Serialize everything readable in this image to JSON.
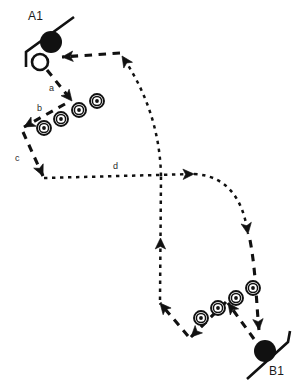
{
  "diagram": {
    "title": "",
    "colors": {
      "ink": "#111111",
      "background": "#ffffff",
      "label": "#1a1a1a"
    },
    "players": [
      {
        "id": "A1",
        "label": "A1",
        "label_pos": {
          "x": 28,
          "y": 10
        },
        "puck_pos": {
          "x": 51,
          "y": 42
        },
        "puck_r": 11,
        "open_circle_pos": {
          "x": 40,
          "y": 62
        },
        "open_circle_r": 8,
        "stick": "M 74 17 L 26 52 L 26 67"
      },
      {
        "id": "B1",
        "label": "B1",
        "label_pos": {
          "x": 269,
          "y": 365
        },
        "puck_pos": {
          "x": 265,
          "y": 351
        },
        "puck_r": 11,
        "stick": "M 247 379 L 288 342 L 290 331"
      }
    ],
    "cone_groups": [
      {
        "name": "upper-left-cones",
        "cones": [
          {
            "x": 44,
            "y": 128
          },
          {
            "x": 61,
            "y": 119
          },
          {
            "x": 79,
            "y": 110
          },
          {
            "x": 97,
            "y": 101
          }
        ]
      },
      {
        "name": "lower-right-cones",
        "cones": [
          {
            "x": 201,
            "y": 318
          },
          {
            "x": 218,
            "y": 308
          },
          {
            "x": 236,
            "y": 298
          },
          {
            "x": 253,
            "y": 288
          }
        ]
      }
    ],
    "cone": {
      "outer_r": 7,
      "mid_r": 4.6,
      "inner_r": 1.9
    },
    "step_labels": [
      {
        "id": "a",
        "text": "a",
        "x": 49,
        "y": 84
      },
      {
        "id": "b",
        "text": "b",
        "x": 37,
        "y": 104
      },
      {
        "id": "c",
        "text": "c",
        "x": 15,
        "y": 154
      },
      {
        "id": "d",
        "text": "d",
        "x": 113,
        "y": 162
      }
    ],
    "paths": [
      {
        "name": "path-a-skate-down",
        "style": "dashed",
        "d": "M 47 70 L 72 101",
        "arrow_at": "end",
        "arrow_angle": 52
      },
      {
        "name": "path-b-skate-up-left",
        "style": "dashed",
        "d": "M 65 104 L 24 127",
        "arrow_at": "end",
        "arrow_angle": 209
      },
      {
        "name": "path-c-skate-down",
        "style": "dashed",
        "d": "M 23 132 L 43 176",
        "arrow_at": "end",
        "arrow_angle": 66
      },
      {
        "name": "path-d-pass-right",
        "style": "dotted",
        "d": "M 44 178 L 194 174",
        "arrow_at": "end",
        "arrow_angle": -1
      },
      {
        "name": "path-pass-curve-down-right",
        "style": "dotted",
        "d": "M 194 174 C 232 176 244 206 248 234",
        "arrow_at": "end",
        "arrow_angle": 80
      },
      {
        "name": "path-skate-down-to-b1",
        "style": "dashed",
        "d": "M 250 240 C 256 272 256 300 259 330",
        "arrow_at": "end",
        "arrow_angle": 83
      },
      {
        "name": "path-b1-skate-up-left",
        "style": "dashed",
        "d": "M 254 339 L 228 303",
        "arrow_at": "end",
        "arrow_angle": 234
      },
      {
        "name": "path-b1-weave-down-left",
        "style": "dashed",
        "d": "M 226 302 L 191 337",
        "arrow_at": "end",
        "arrow_angle": 135
      },
      {
        "name": "path-b1-skate-up-left-2",
        "style": "dashed",
        "d": "M 188 336 L 160 303",
        "arrow_at": "end",
        "arrow_angle": 229
      },
      {
        "name": "path-pass-up-vertical",
        "style": "dotted",
        "d": "M 160 300 L 161 176",
        "arrow_at": "mid",
        "arrow_angle": -90
      },
      {
        "name": "path-pass-curve-up-left",
        "style": "dotted",
        "d": "M 161 176 C 160 128 144 88 122 56",
        "arrow_at": "end",
        "arrow_angle": 235
      },
      {
        "name": "path-pass-left-to-a1",
        "style": "dashed",
        "d": "M 120 53 L 62 57",
        "arrow_at": "end",
        "arrow_angle": 184
      }
    ]
  }
}
